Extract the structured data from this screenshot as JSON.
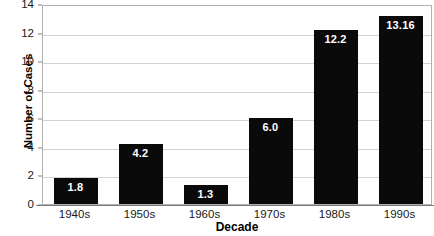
{
  "chart_data": {
    "type": "bar",
    "title": "",
    "subtitle": "",
    "xlabel": "Decade",
    "ylabel": "Number of Cases",
    "categories": [
      "1940s",
      "1950s",
      "1960s",
      "1970s",
      "1980s",
      "1990s"
    ],
    "values": [
      1.8,
      4.2,
      1.3,
      6.0,
      12.2,
      13.16
    ],
    "value_labels": [
      "1.8",
      "4.2",
      "1.3",
      "6.0",
      "12.2",
      "13.16"
    ],
    "ylim": [
      0,
      14
    ],
    "yticks": [
      0,
      2,
      4,
      6,
      8,
      10,
      12,
      14
    ],
    "ytick_labels": [
      "0",
      "2",
      "4",
      "6",
      "8",
      "10",
      "12",
      "14"
    ],
    "grid": true,
    "grid_axis": "y",
    "legend": false,
    "legend_position": "none",
    "bar_color": "#0a0a0a",
    "value_label_color": "#ffffff",
    "grid_color": "#d2d2d2",
    "plot_border_color": "#b0b0b0",
    "background_color": "#ffffff"
  }
}
